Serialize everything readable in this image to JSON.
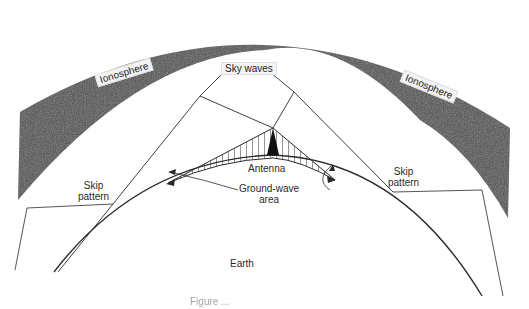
{
  "figure": {
    "colors": {
      "ionosphere_fill": "#4e4e4e",
      "line": "#2b2b2b",
      "background": "#ffffff",
      "label_box": "#f4f4f4"
    }
  },
  "labels": {
    "ionosphere_left": "Ionosphere",
    "ionosphere_right": "Ionosphere",
    "sky_waves": "Sky waves",
    "antenna": "Antenna",
    "ground_wave_line1": "Ground-wave",
    "ground_wave_line2": "area",
    "skip_left_line1": "Skip",
    "skip_left_line2": "pattern",
    "skip_right_line1": "Skip",
    "skip_right_line2": "pattern",
    "earth": "Earth"
  },
  "caption": {
    "text": "Figure ..."
  },
  "diagram": {
    "nodes": [
      {
        "id": "ionosphere",
        "label": "Ionosphere",
        "shape": "arc-band"
      },
      {
        "id": "earth",
        "label": "Earth",
        "shape": "arc"
      },
      {
        "id": "antenna",
        "label": "Antenna",
        "shape": "triangle"
      },
      {
        "id": "ground-wave-area",
        "label": "Ground-wave area",
        "shape": "hatched-region"
      },
      {
        "id": "skip-left",
        "label": "Skip pattern",
        "shape": "point"
      },
      {
        "id": "skip-right",
        "label": "Skip pattern",
        "shape": "point"
      },
      {
        "id": "sky-waves",
        "label": "Sky waves",
        "shape": "rays"
      }
    ],
    "edges": [
      {
        "from": "antenna",
        "to": "ionosphere",
        "label": "Sky waves (left ray)"
      },
      {
        "from": "ionosphere",
        "to": "skip-left",
        "label": "reflected ray"
      },
      {
        "from": "antenna",
        "to": "ionosphere",
        "label": "Sky waves (right ray)"
      },
      {
        "from": "ionosphere",
        "to": "skip-right",
        "label": "reflected ray"
      },
      {
        "from": "antenna",
        "to": "ground-wave-area",
        "label": "ground wave"
      }
    ]
  }
}
